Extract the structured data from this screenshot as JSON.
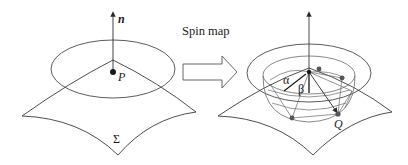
{
  "figure": {
    "left_panel": {
      "normal_label": "n",
      "point_label": "P",
      "surface_label": "Σ"
    },
    "transition": {
      "arrow_label": "Spin map"
    },
    "right_panel": {
      "alpha_label": "α",
      "beta_label": "β",
      "point_label": "Q"
    },
    "colors": {
      "line": "#3a3a3a",
      "light_line": "#6a6a6a",
      "point": "#1a1a1a",
      "grey_point": "#555555",
      "background": "#ffffff"
    }
  }
}
